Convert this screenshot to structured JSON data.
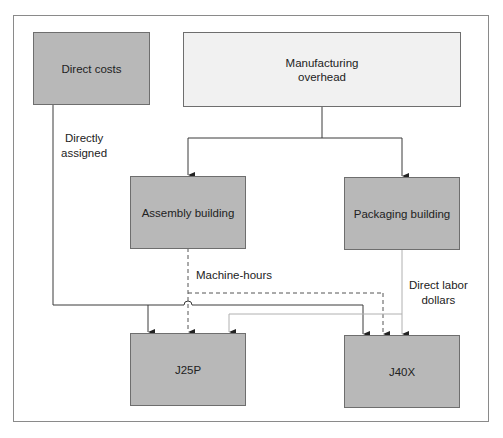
{
  "diagram": {
    "nodes": {
      "direct_costs": {
        "label": "Direct costs"
      },
      "manufacturing_overhead": {
        "label": "Manufacturing\noverhead",
        "line1": "Manufacturing",
        "line2": "overhead"
      },
      "assembly_building": {
        "label": "Assembly building"
      },
      "packaging_building": {
        "label": "Packaging building"
      },
      "j25p": {
        "label": "J25P"
      },
      "j40x": {
        "label": "J40X"
      }
    },
    "edge_labels": {
      "directly_assigned_line1": "Directly",
      "directly_assigned_line2": "assigned",
      "machine_hours": "Machine-hours",
      "direct_labor_line1": "Direct labor",
      "direct_labor_line2": "dollars"
    },
    "edges": [
      {
        "from": "Manufacturing overhead",
        "to": "Assembly building",
        "style": "solid"
      },
      {
        "from": "Manufacturing overhead",
        "to": "Packaging building",
        "style": "solid"
      },
      {
        "from": "Direct costs",
        "to": "J25P",
        "style": "solid",
        "label": "Directly assigned"
      },
      {
        "from": "Direct costs",
        "to": "J40X",
        "style": "solid",
        "label": "Directly assigned"
      },
      {
        "from": "Assembly building",
        "to": "J25P",
        "style": "dashed",
        "label": "Machine-hours"
      },
      {
        "from": "Assembly building",
        "to": "J40X",
        "style": "dashed",
        "label": "Machine-hours"
      },
      {
        "from": "Packaging building",
        "to": "J25P",
        "style": "dotted",
        "label": "Direct labor dollars"
      },
      {
        "from": "Packaging building",
        "to": "J40X",
        "style": "dotted",
        "label": "Direct labor dollars"
      }
    ],
    "colors": {
      "dark_box": "#b8b8b8",
      "light_box": "#f1f1f1",
      "line": "#3a3a3a",
      "dotted_line": "#b0b0b0",
      "frame": "#8a8a8a"
    }
  }
}
